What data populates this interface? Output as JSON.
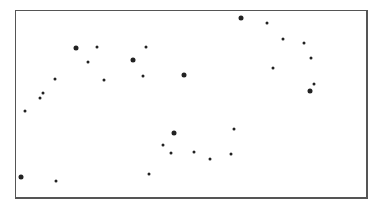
{
  "chart_data": {
    "type": "scatter",
    "title": "",
    "xlabel": "",
    "ylabel": "",
    "grid": false,
    "legend": null,
    "frame": {
      "left": 15,
      "top": 10,
      "right": 369,
      "bottom": 200
    },
    "points": [
      {
        "x": 76,
        "y": 48,
        "size": "large"
      },
      {
        "x": 97,
        "y": 47,
        "size": "small"
      },
      {
        "x": 88,
        "y": 62,
        "size": "small"
      },
      {
        "x": 133,
        "y": 60,
        "size": "large"
      },
      {
        "x": 146,
        "y": 47,
        "size": "small"
      },
      {
        "x": 55,
        "y": 79,
        "size": "small"
      },
      {
        "x": 104,
        "y": 80,
        "size": "small"
      },
      {
        "x": 143,
        "y": 76,
        "size": "small"
      },
      {
        "x": 184,
        "y": 75,
        "size": "large"
      },
      {
        "x": 43,
        "y": 93,
        "size": "small"
      },
      {
        "x": 40,
        "y": 98,
        "size": "small"
      },
      {
        "x": 241,
        "y": 18,
        "size": "large"
      },
      {
        "x": 267,
        "y": 23,
        "size": "small"
      },
      {
        "x": 283,
        "y": 39,
        "size": "small"
      },
      {
        "x": 304,
        "y": 43,
        "size": "small"
      },
      {
        "x": 311,
        "y": 58,
        "size": "small"
      },
      {
        "x": 273,
        "y": 68,
        "size": "small"
      },
      {
        "x": 314,
        "y": 84,
        "size": "small"
      },
      {
        "x": 310,
        "y": 91,
        "size": "large"
      },
      {
        "x": 25,
        "y": 111,
        "size": "small"
      },
      {
        "x": 21,
        "y": 177,
        "size": "large"
      },
      {
        "x": 56,
        "y": 181,
        "size": "small"
      },
      {
        "x": 149,
        "y": 174,
        "size": "small"
      },
      {
        "x": 174,
        "y": 133,
        "size": "large"
      },
      {
        "x": 163,
        "y": 145,
        "size": "small"
      },
      {
        "x": 171,
        "y": 153,
        "size": "small"
      },
      {
        "x": 194,
        "y": 152,
        "size": "small"
      },
      {
        "x": 234,
        "y": 129,
        "size": "small"
      },
      {
        "x": 210,
        "y": 159,
        "size": "small"
      },
      {
        "x": 231,
        "y": 154,
        "size": "small"
      }
    ],
    "colors": {
      "point": "#222222",
      "frame": "#555555"
    }
  }
}
